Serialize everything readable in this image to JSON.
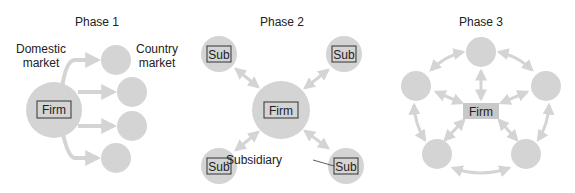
{
  "colors": {
    "node_fill": "#d4d4d4",
    "arrow": "#d4d4d4",
    "box_stroke": "#333333",
    "phase3_box_fill": "#c8c8c8",
    "text": "#222222"
  },
  "phase1": {
    "title": "Phase 1",
    "domestic_label_line1": "Domestic",
    "domestic_label_line2": "market",
    "country_label_line1": "Country",
    "country_label_line2": "market",
    "firm_label": "Firm",
    "country_market_count": 4
  },
  "phase2": {
    "title": "Phase 2",
    "firm_label": "Firm",
    "subs": [
      "Sub",
      "Sub",
      "Sub",
      "Sub"
    ],
    "subsidiary_label": "Subsidiary"
  },
  "phase3": {
    "title": "Phase 3",
    "firm_label": "Firm",
    "node_count": 5
  }
}
